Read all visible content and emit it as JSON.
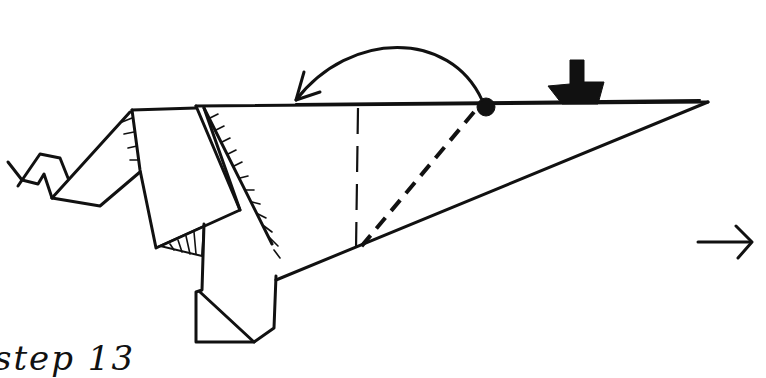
{
  "diagram": {
    "type": "origami-instruction-step",
    "step_label": "step 13",
    "instructions": {
      "fold_arrow": "curved arrow showing flap folded over to the left",
      "pivot_point": "black dot on top edge",
      "push_arrow": "solid black push/press arrow pointing down",
      "fold_lines": [
        "vertical dashed line",
        "diagonal dashed line from dot to bottom edge"
      ],
      "next_arrow": "arrow pointing right to next step"
    },
    "colors": {
      "ink": "#111111",
      "background": "#ffffff"
    }
  }
}
